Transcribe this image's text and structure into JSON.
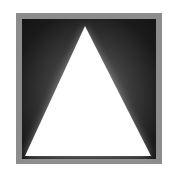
{
  "figure": {
    "colors": {
      "background": "#ffffff",
      "border": "#8c8c8c",
      "inner_dark": "#141414",
      "inner_glow": "#7a7a7a",
      "triangle": "#ffffff"
    },
    "triangle_points": [
      [
        85,
        26
      ],
      [
        25,
        156
      ],
      [
        151,
        156
      ]
    ]
  }
}
